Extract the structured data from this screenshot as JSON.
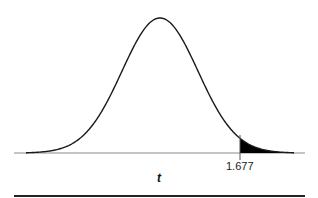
{
  "chart_data": {
    "type": "area",
    "title": "",
    "subtitle": "",
    "xlabel": "t",
    "ylabel": "",
    "critical_value": 1.677,
    "critical_value_label": "1.677",
    "shaded_region": "upper tail (t > 1.677)",
    "grid": false,
    "legend": null,
    "colors": {
      "curve": "#1a1a1a",
      "shade": "#000000",
      "axis": "#888888",
      "rule": "#222222"
    }
  }
}
